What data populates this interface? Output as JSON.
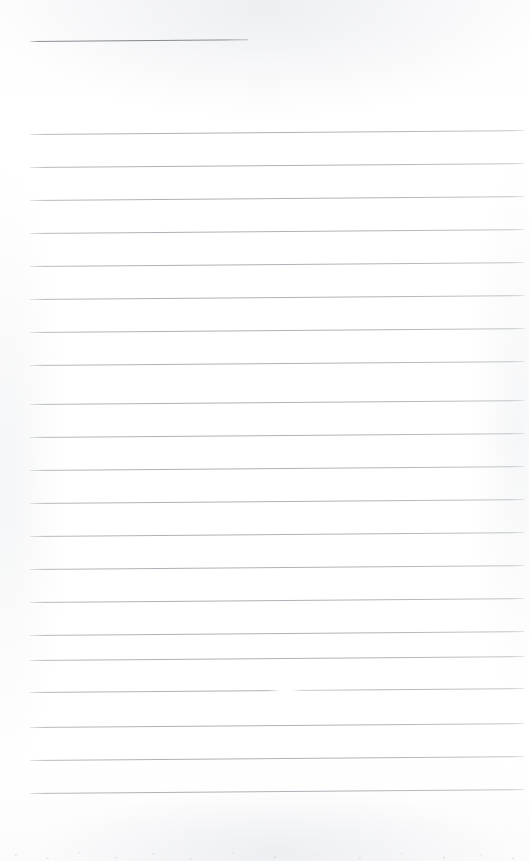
{
  "document": {
    "kind": "blank-ruled-notepaper-scan",
    "title": "",
    "page_width": 529,
    "page_height": 861,
    "background_color": "#fefefe",
    "rule_color": "#b0b4ba",
    "heading_rule_color": "#868a91",
    "written_text": "",
    "notes": "Blank scanned sheet of ruled notepaper. No handwriting, typed text, headings or page numbers are present.",
    "margins": {
      "left_px": 30,
      "right_px": 524,
      "first_rule_top_px": 41,
      "last_rule_top_px": 793,
      "bottom_blank_px": 68
    },
    "ruling": {
      "line_spacing_px": 33,
      "line_slope_deg": -0.45,
      "body_line_count": 21,
      "heading_line_count": 1,
      "total_line_count": 22
    },
    "rules": [
      {
        "id": "rule-heading",
        "top": 41,
        "left": 30,
        "width": 218,
        "style": "heading",
        "label": "heading-rule"
      },
      {
        "id": "rule-1",
        "top": 134,
        "left": 30,
        "width": 494,
        "style": "body",
        "label": "rule-1"
      },
      {
        "id": "rule-2",
        "top": 167,
        "left": 30,
        "width": 494,
        "style": "body",
        "label": "rule-2"
      },
      {
        "id": "rule-3",
        "top": 200,
        "left": 30,
        "width": 494,
        "style": "body",
        "label": "rule-3"
      },
      {
        "id": "rule-4",
        "top": 233,
        "left": 30,
        "width": 494,
        "style": "body",
        "label": "rule-4"
      },
      {
        "id": "rule-5",
        "top": 266,
        "left": 30,
        "width": 494,
        "style": "body",
        "label": "rule-5"
      },
      {
        "id": "rule-6",
        "top": 299,
        "left": 30,
        "width": 494,
        "style": "body",
        "label": "rule-6"
      },
      {
        "id": "rule-7",
        "top": 332,
        "left": 30,
        "width": 494,
        "style": "body",
        "label": "rule-7"
      },
      {
        "id": "rule-8",
        "top": 365,
        "left": 30,
        "width": 494,
        "style": "body",
        "label": "rule-8"
      },
      {
        "id": "rule-9",
        "top": 404,
        "left": 30,
        "width": 494,
        "style": "body",
        "label": "rule-9"
      },
      {
        "id": "rule-10",
        "top": 437,
        "left": 30,
        "width": 494,
        "style": "body",
        "label": "rule-10"
      },
      {
        "id": "rule-11",
        "top": 470,
        "left": 30,
        "width": 494,
        "style": "body",
        "label": "rule-11"
      },
      {
        "id": "rule-12",
        "top": 503,
        "left": 30,
        "width": 494,
        "style": "body",
        "label": "rule-12"
      },
      {
        "id": "rule-13",
        "top": 536,
        "left": 30,
        "width": 494,
        "style": "body",
        "label": "rule-13"
      },
      {
        "id": "rule-14",
        "top": 569,
        "left": 30,
        "width": 494,
        "style": "body",
        "label": "rule-14"
      },
      {
        "id": "rule-15",
        "top": 602,
        "left": 30,
        "width": 494,
        "style": "body",
        "label": "rule-15"
      },
      {
        "id": "rule-16",
        "top": 635,
        "left": 30,
        "width": 494,
        "style": "body",
        "label": "rule-16"
      },
      {
        "id": "rule-17",
        "top": 660,
        "left": 30,
        "width": 494,
        "style": "body",
        "label": "rule-17"
      },
      {
        "id": "rule-18",
        "top": 692,
        "left": 30,
        "width": 494,
        "style": "broken",
        "label": "rule-18"
      },
      {
        "id": "rule-19",
        "top": 727,
        "left": 30,
        "width": 494,
        "style": "body",
        "label": "rule-19"
      },
      {
        "id": "rule-20",
        "top": 760,
        "left": 30,
        "width": 494,
        "style": "body",
        "label": "rule-20"
      },
      {
        "id": "rule-21",
        "top": 793,
        "left": 30,
        "width": 494,
        "style": "body",
        "label": "rule-21"
      }
    ]
  }
}
